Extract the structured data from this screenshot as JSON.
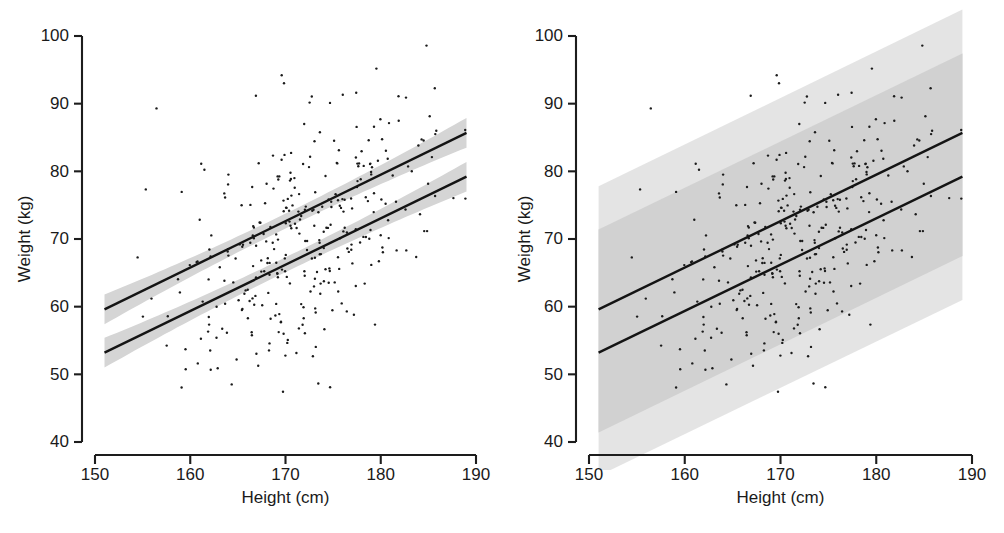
{
  "figure": {
    "panel_count": 2,
    "background": "#ffffff",
    "line_color": "#141414",
    "point_color": "#1b1b1b",
    "ci_band_color": "#d5d5d5",
    "pi_band_color_light": "#e2e2e2",
    "pi_band_color_dark": "#c6c6c6"
  },
  "chart_data": [
    {
      "type": "scatter",
      "panel": "left",
      "title": "",
      "xlabel": "Height (cm)",
      "ylabel": "Weight (kg)",
      "xlim": [
        150,
        190
      ],
      "ylim": [
        40,
        100
      ],
      "xticks": [
        150,
        160,
        170,
        180,
        190
      ],
      "yticks": [
        40,
        50,
        60,
        70,
        80,
        90,
        100
      ],
      "xtick_labels": [
        "150",
        "160",
        "170",
        "180",
        "190"
      ],
      "ytick_labels": [
        "40",
        "50",
        "60",
        "70",
        "80",
        "90",
        "100"
      ],
      "grid": false,
      "legend": "none",
      "band_type": "confidence",
      "band_label": "95% confidence interval of the mean",
      "series": [
        {
          "name": "upper regression line",
          "type": "line",
          "x": [
            151.0,
            189.0
          ],
          "y": [
            59.6,
            85.7
          ],
          "slope": 0.6868,
          "intercept": -44.1,
          "band_halfwidth_at_center_kg": 1.1,
          "band_halfwidth_at_ends_kg": 2.2
        },
        {
          "name": "lower regression line",
          "type": "line",
          "x": [
            151.0,
            189.0
          ],
          "y": [
            53.2,
            79.2
          ],
          "slope": 0.6842,
          "intercept": -50.1,
          "band_halfwidth_at_center_kg": 1.1,
          "band_halfwidth_at_ends_kg": 2.2
        },
        {
          "name": "observations",
          "type": "scatter",
          "n_points": 330,
          "x_mean": 172.0,
          "x_sd": 7.0,
          "y_sd_resid": 8.6,
          "marker": "point",
          "marker_size_px": 2.4
        }
      ]
    },
    {
      "type": "scatter",
      "panel": "right",
      "title": "",
      "xlabel": "Height (cm)",
      "ylabel": "Weight (kg)",
      "xlim": [
        150,
        190
      ],
      "ylim": [
        40,
        100
      ],
      "xticks": [
        150,
        160,
        170,
        180,
        190
      ],
      "yticks": [
        40,
        50,
        60,
        70,
        80,
        90,
        100
      ],
      "xtick_labels": [
        "150",
        "160",
        "170",
        "180",
        "190"
      ],
      "ytick_labels": [
        "40",
        "50",
        "60",
        "70",
        "80",
        "90",
        "100"
      ],
      "grid": false,
      "legend": "none",
      "band_type": "prediction",
      "band_label": "95% prediction interval for individuals",
      "series": [
        {
          "name": "upper regression line",
          "type": "line",
          "x": [
            151.0,
            189.0
          ],
          "y": [
            59.6,
            85.7
          ],
          "slope": 0.6868,
          "intercept": -44.1,
          "band_halfwidth_kg": 18.2
        },
        {
          "name": "lower regression line",
          "type": "line",
          "x": [
            151.0,
            189.0
          ],
          "y": [
            53.2,
            79.2
          ],
          "slope": 0.6842,
          "intercept": -50.1,
          "band_halfwidth_kg": 18.2
        },
        {
          "name": "observations",
          "type": "scatter",
          "n_points": 330,
          "x_mean": 172.0,
          "x_sd": 7.0,
          "y_sd_resid": 8.6,
          "marker": "point",
          "marker_size_px": 2.4
        }
      ]
    }
  ]
}
